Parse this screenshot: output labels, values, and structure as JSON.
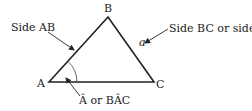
{
  "diagram": {
    "vertices": {
      "A": {
        "label": "A",
        "x": 49,
        "y": 82
      },
      "B": {
        "label": "B",
        "x": 108,
        "y": 17
      },
      "C": {
        "label": "C",
        "x": 154,
        "y": 82
      }
    },
    "side_a_label": "a",
    "annotations": {
      "side_ab": "Side AB",
      "side_bc_prefix": "Side BC or side ",
      "side_bc_var": "a",
      "angle_a": "Â or BÂC"
    },
    "colors": {
      "stroke": "#222222",
      "text": "#222222",
      "background": "#ffffff"
    }
  }
}
